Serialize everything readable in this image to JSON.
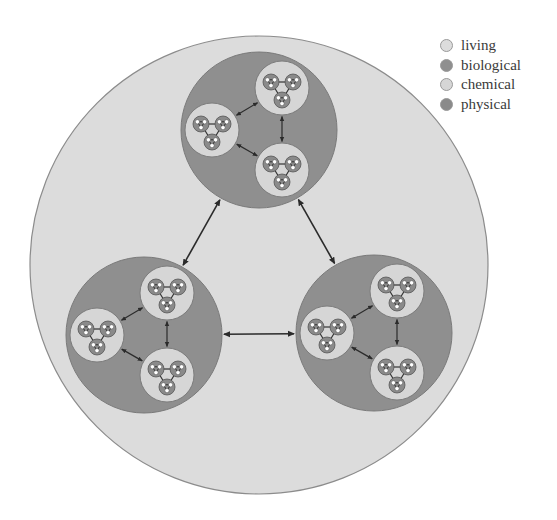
{
  "legend": {
    "items": [
      {
        "label": "living",
        "color": "#dcdcdc"
      },
      {
        "label": "biological",
        "color": "#8f8f8f"
      },
      {
        "label": "chemical",
        "color": "#d6d6d6"
      },
      {
        "label": "physical",
        "color": "#8a8a8a"
      }
    ]
  },
  "colors": {
    "living_fill": "#dcdcdc",
    "living_stroke": "#8c8c8c",
    "biological_fill": "#8f8f8f",
    "biological_stroke": "#7a7a7a",
    "chemical_fill": "#d6d6d6",
    "chemical_stroke": "#7c7c7c",
    "physical_fill": "#8a8a8a",
    "physical_stroke": "#555555",
    "arrow": "#2b2b2b",
    "dot": "#ffffff"
  },
  "diagram": {
    "living": {
      "cx": 259,
      "cy": 265,
      "r": 229,
      "label": "living"
    },
    "biological": [
      {
        "cx": 259,
        "cy": 130,
        "r": 78,
        "label": "biological"
      },
      {
        "cx": 144,
        "cy": 335,
        "r": 78,
        "label": "biological"
      },
      {
        "cx": 374,
        "cy": 333,
        "r": 78,
        "label": "biological"
      }
    ],
    "chemical_offsets": [
      [
        23,
        -42
      ],
      [
        -47,
        0
      ],
      [
        23,
        40
      ]
    ],
    "chemical_r": 27,
    "physical_offsets": [
      [
        -11,
        -6
      ],
      [
        11,
        -6
      ],
      [
        0,
        12
      ]
    ],
    "physical_r": 8
  }
}
